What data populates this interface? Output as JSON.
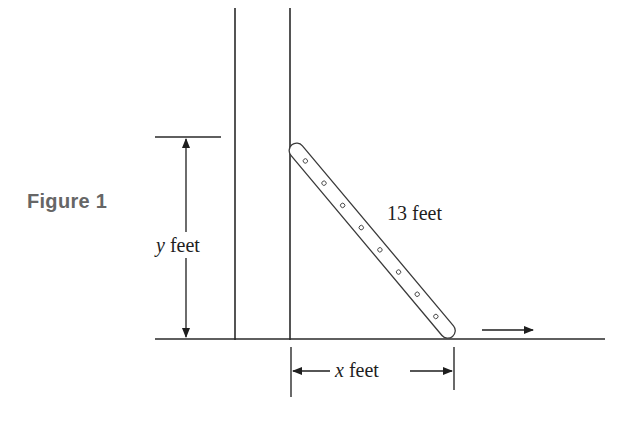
{
  "caption": "Figure 1",
  "labels": {
    "y_var": "y",
    "y_unit": " feet",
    "ladder_length": "13 feet",
    "x_var": "x",
    "x_unit": " feet"
  },
  "diagram": {
    "ladder_length_ft": 13,
    "ladder_rung_count": 8,
    "vertical_dimension": "y feet",
    "horizontal_dimension": "x feet",
    "motion_arrow_direction": "right",
    "colors": {
      "line": "#2a2a2a",
      "caption": "#666666",
      "background": "#ffffff"
    }
  }
}
